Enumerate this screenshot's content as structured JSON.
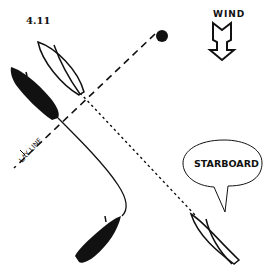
{
  "figure": {
    "number": "4.11",
    "wind_label": "WIND",
    "wind_direction": "down",
    "layline_label": "LAY LINE",
    "callout_text": "STARBOARD",
    "mark": "windward-mark",
    "colors": {
      "ink": "#111111",
      "background": "#ffffff"
    },
    "boats": [
      {
        "id": "boat-a-outline-upper",
        "fill": "outline",
        "position": "upper-center, on lay line"
      },
      {
        "id": "boat-b-solid-upper",
        "fill": "solid",
        "position": "upper-left"
      },
      {
        "id": "boat-c-solid-lower",
        "fill": "solid",
        "position": "lower-center"
      },
      {
        "id": "boat-d-outline-lower",
        "fill": "outline",
        "position": "lower-right, hailing"
      }
    ]
  }
}
